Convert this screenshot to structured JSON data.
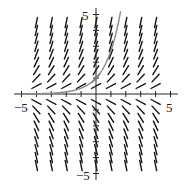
{
  "chart_data": {
    "type": "scatter",
    "subtype": "slope_field",
    "title": "",
    "xlabel": "",
    "ylabel": "",
    "xlim": [
      -5.5,
      5.5
    ],
    "ylim": [
      -5.5,
      5.5
    ],
    "grid": false,
    "x_tick_labels": [
      {
        "value": -5,
        "label": "-5"
      },
      {
        "value": 5,
        "label": "5"
      }
    ],
    "y_tick_labels": [
      {
        "value": 5,
        "label": "5"
      },
      {
        "value": -5,
        "label": "-5"
      }
    ],
    "x_ticks": [
      -5,
      -4,
      -3,
      -2,
      -1,
      1,
      2,
      3,
      4,
      5
    ],
    "y_ticks": [
      -5,
      -4,
      -3,
      -2,
      -1,
      1,
      2,
      3,
      4,
      5
    ],
    "differential_equation": "dy/dx = y",
    "field_columns_x": [
      -4,
      -3,
      -2,
      -1,
      0,
      1,
      2,
      3,
      4
    ],
    "field_rows_y": [
      -4.5,
      -4,
      -3.5,
      -3,
      -2.5,
      -2,
      -1.5,
      -1,
      -0.5,
      0.5,
      1,
      1.5,
      2,
      2.5,
      3,
      3.5,
      4,
      4.5
    ],
    "solution_curve": {
      "equation": "y = e^x",
      "color": "#8a8a8a",
      "x_range": [
        -5,
        1.65
      ]
    },
    "colors": {
      "segments": "#111111",
      "axes": "#222222",
      "curve": "#8a8a8a"
    }
  }
}
